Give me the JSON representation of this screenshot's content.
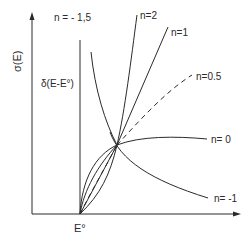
{
  "figure": {
    "y_axis_label": "σ(E)",
    "x_axis_label": "E°",
    "delta_label": "δ(E-E°)",
    "ink_color": "#2a2a2a",
    "background": "#ffffff",
    "curves": [
      {
        "id": "n_-1.5",
        "label": "n = - 1,5",
        "style": "solid"
      },
      {
        "id": "n_2",
        "label": "n=2",
        "style": "solid"
      },
      {
        "id": "n_1",
        "label": "n=1",
        "style": "solid"
      },
      {
        "id": "n_0.5",
        "label": "n=0.5",
        "style": "dashed"
      },
      {
        "id": "n_0",
        "label": "n= 0",
        "style": "solid"
      },
      {
        "id": "n_-1",
        "label": "n= -1",
        "style": "solid"
      }
    ]
  }
}
